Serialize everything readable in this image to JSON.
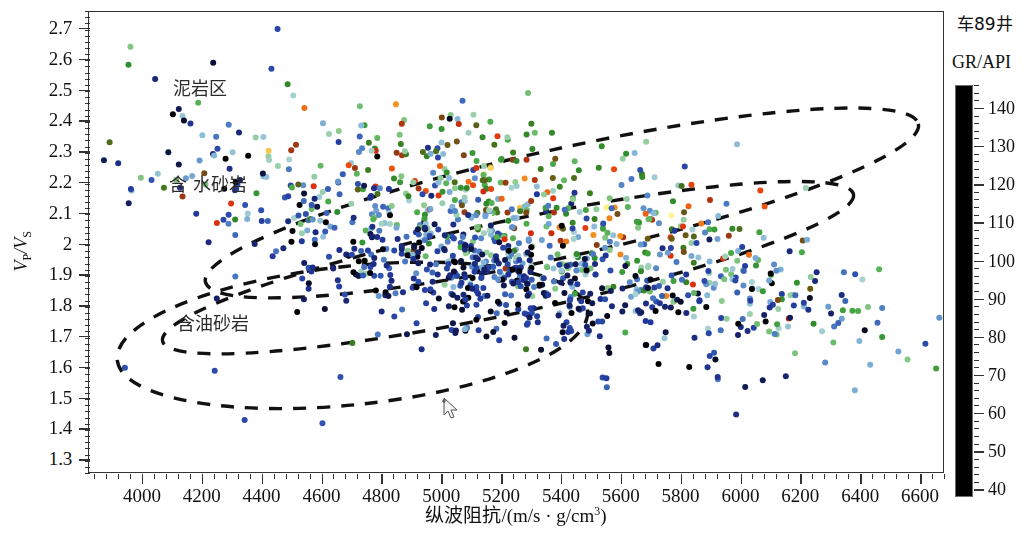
{
  "figure": {
    "well_name": "车89井",
    "background_color": "#ffffff",
    "frame_color": "#333333"
  },
  "axes": {
    "x": {
      "title_html": "纵波阻抗/(m/s · g/cm<sup>3</sup>)",
      "title_text": "纵波阻抗/(m/s · g/cm3)",
      "min": 3820,
      "max": 6680,
      "ticks": [
        4000,
        4200,
        4400,
        4600,
        4800,
        5000,
        5200,
        5400,
        5600,
        5800,
        6000,
        6200,
        6400,
        6600
      ],
      "minor_step": 40
    },
    "y": {
      "title_html": "<i>V</i><sub>P</sub>/<i>V</i><sub>S</sub>",
      "title_text": "VP/VS",
      "min": 1.255,
      "max": 2.755,
      "ticks": [
        1.3,
        1.4,
        1.5,
        1.6,
        1.7,
        1.8,
        1.9,
        2,
        2.1,
        2.2,
        2.3,
        2.4,
        2.5,
        2.6,
        2.7
      ],
      "tick_labels": [
        "1.3",
        "1.4",
        "1.5",
        "1.6",
        "1.7",
        "1.8",
        "1.9",
        "2",
        "2.1",
        "2.2",
        "2.3",
        "2.4",
        "2.5",
        "2.6",
        "2.7"
      ],
      "minor_step": 0.02
    }
  },
  "colorbar": {
    "title": "GR/API",
    "min": 38,
    "max": 146,
    "ticks": [
      40,
      50,
      60,
      70,
      80,
      90,
      100,
      110,
      120,
      130,
      140
    ],
    "minor_step": 2,
    "stops": [
      {
        "pos": 0.0,
        "color": "#000000"
      },
      {
        "pos": 0.04,
        "color": "#070a23"
      },
      {
        "pos": 0.115,
        "color": "#16246e"
      },
      {
        "pos": 0.19,
        "color": "#22389c"
      },
      {
        "pos": 0.265,
        "color": "#2f53b0"
      },
      {
        "pos": 0.33,
        "color": "#4f7fc4"
      },
      {
        "pos": 0.395,
        "color": "#82b4d8"
      },
      {
        "pos": 0.44,
        "color": "#a9d2d2"
      },
      {
        "pos": 0.49,
        "color": "#8ecb8e"
      },
      {
        "pos": 0.545,
        "color": "#4fae4c"
      },
      {
        "pos": 0.6,
        "color": "#2f8f2d"
      },
      {
        "pos": 0.65,
        "color": "#3d7a1f"
      },
      {
        "pos": 0.7,
        "color": "#8a3d12"
      },
      {
        "pos": 0.745,
        "color": "#d62b0d"
      },
      {
        "pos": 0.8,
        "color": "#e8440c"
      },
      {
        "pos": 0.85,
        "color": "#ef7b1a"
      },
      {
        "pos": 0.89,
        "color": "#f3a524"
      },
      {
        "pos": 0.925,
        "color": "#fbf37c"
      },
      {
        "pos": 0.948,
        "color": "#ffffff"
      },
      {
        "pos": 0.962,
        "color": "#ffffff"
      },
      {
        "pos": 0.975,
        "color": "#f2f05a"
      },
      {
        "pos": 0.99,
        "color": "#b9a91c"
      },
      {
        "pos": 1.0,
        "color": "#6b5a12"
      }
    ]
  },
  "regions": [
    {
      "key": "mudstone",
      "label": "泥岩区"
    },
    {
      "key": "water_sandstone",
      "label": "含 水砂岩"
    },
    {
      "key": "oil_sandstone",
      "label": "含油砂岩"
    }
  ],
  "chart_data": {
    "type": "scatter",
    "title": "车89井",
    "xlabel": "纵波阻抗/(m/s · g/cm3)",
    "ylabel": "VP/VS",
    "xlim": [
      3820,
      6680
    ],
    "ylim": [
      1.255,
      2.755
    ],
    "grid": false,
    "legend": "colorbar-right",
    "color_variable": "GR/API",
    "color_range": [
      38,
      146
    ],
    "point_count_estimate": 1180,
    "marker": {
      "shape": "circle",
      "size_px": 6
    },
    "clusters": [
      {
        "name": "mudstone-high-GR",
        "n": 330,
        "x_mean": 5320,
        "x_sd": 420,
        "slope": -0.000245,
        "y_at_xmean": 2.17,
        "y_sd": 0.105,
        "gr_mean": 101,
        "gr_sd": 20
      },
      {
        "name": "water-sandstone-mid-GR",
        "n": 300,
        "x_mean": 5180,
        "x_sd": 430,
        "slope": -0.000225,
        "y_at_xmean": 2.01,
        "y_sd": 0.085,
        "gr_mean": 82,
        "gr_sd": 15
      },
      {
        "name": "oil-sandstone-low-GR",
        "n": 420,
        "x_mean": 5140,
        "x_sd": 420,
        "slope": -0.000205,
        "y_at_xmean": 1.88,
        "y_sd": 0.095,
        "gr_mean": 55,
        "gr_sd": 12
      },
      {
        "name": "right-tail-scatter",
        "n": 95,
        "x_mean": 6080,
        "x_sd": 250,
        "slope": -0.00019,
        "y_at_xmean": 1.83,
        "y_sd": 0.085,
        "gr_mean": 74,
        "gr_sd": 22
      },
      {
        "name": "left-sparse-scatter",
        "n": 35,
        "x_mean": 4180,
        "x_sd": 150,
        "slope": -0.00022,
        "y_at_xmean": 2.29,
        "y_sd": 0.115,
        "gr_mean": 70,
        "gr_sd": 28
      }
    ],
    "outliers": [
      {
        "x": 4450,
        "y": 2.7,
        "gr": 62
      },
      {
        "x": 4235,
        "y": 2.59,
        "gr": 44
      },
      {
        "x": 4185,
        "y": 2.46,
        "gr": 96
      },
      {
        "x": 4120,
        "y": 2.44,
        "gr": 48
      },
      {
        "x": 4245,
        "y": 2.35,
        "gr": 72
      },
      {
        "x": 4085,
        "y": 2.3,
        "gr": 45
      },
      {
        "x": 4300,
        "y": 2.3,
        "gr": 83
      },
      {
        "x": 4120,
        "y": 2.26,
        "gr": 46
      },
      {
        "x": 4050,
        "y": 2.23,
        "gr": 83
      },
      {
        "x": 3960,
        "y": 2.18,
        "gr": 60
      },
      {
        "x": 4700,
        "y": 1.68,
        "gr": 108
      },
      {
        "x": 5280,
        "y": 1.66,
        "gr": 108
      },
      {
        "x": 3940,
        "y": 1.6,
        "gr": 66
      },
      {
        "x": 4240,
        "y": 1.59,
        "gr": 64
      },
      {
        "x": 4660,
        "y": 1.57,
        "gr": 66
      },
      {
        "x": 4340,
        "y": 1.43,
        "gr": 63
      },
      {
        "x": 4600,
        "y": 1.42,
        "gr": 67
      },
      {
        "x": 6460,
        "y": 1.92,
        "gr": 96
      },
      {
        "x": 6470,
        "y": 1.7,
        "gr": 101
      },
      {
        "x": 6430,
        "y": 1.61,
        "gr": 80
      }
    ],
    "annotations": [
      {
        "text": "泥岩区",
        "x": 4260,
        "y": 2.53,
        "type": "region-label"
      },
      {
        "text": "含 水砂岩",
        "x": 4250,
        "y": 2.22,
        "type": "region-label"
      },
      {
        "text": "含油砂岩",
        "x": 4270,
        "y": 1.77,
        "type": "region-label"
      }
    ],
    "region_outlines": [
      {
        "key": "mudstone",
        "style": "dashed-ellipse",
        "cx": 5400,
        "cy": 2.135,
        "rx": 1220,
        "ry": 0.175,
        "rotation_deg": -12.5
      },
      {
        "key": "water_sandstone",
        "style": "dashed-ellipse",
        "cx": 5220,
        "cy": 1.925,
        "rx": 1180,
        "ry": 0.15,
        "rotation_deg": -12.0
      },
      {
        "key": "oil_sandstone",
        "style": "dashed-ellipse",
        "cx": 4700,
        "cy": 1.705,
        "rx": 790,
        "ry": 0.225,
        "rotation_deg": -6.0
      }
    ]
  },
  "cursor": {
    "present": true,
    "shape": "arrow-with-crosshair",
    "x": 352,
    "y": 385
  }
}
